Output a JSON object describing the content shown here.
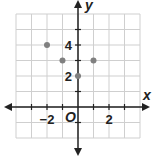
{
  "chart_data": {
    "type": "scatter",
    "title": "",
    "xlabel": "x",
    "ylabel": "y",
    "origin_label": "O",
    "xlim": [
      -4,
      4
    ],
    "ylim": [
      -2,
      6
    ],
    "grid": true,
    "x_ticks": [
      {
        "value": -2,
        "label": "−2"
      },
      {
        "value": 2,
        "label": "2"
      }
    ],
    "y_ticks": [
      {
        "value": 2,
        "label": "2"
      },
      {
        "value": 4,
        "label": "4"
      }
    ],
    "points": [
      {
        "x": -2,
        "y": 4
      },
      {
        "x": -1,
        "y": 3
      },
      {
        "x": 0,
        "y": 2
      },
      {
        "x": 1,
        "y": 3
      }
    ],
    "point_color": "#808080"
  }
}
